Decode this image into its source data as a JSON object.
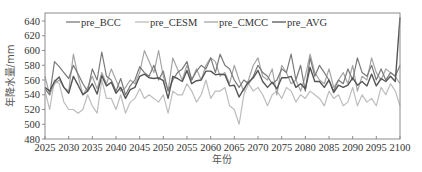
{
  "chart_data": {
    "type": "line",
    "title": "",
    "xlabel": "年份",
    "ylabel": "年降水量/mm",
    "xlim": [
      2025,
      2100
    ],
    "ylim": [
      480,
      650
    ],
    "x_ticks": [
      2025,
      2030,
      2035,
      2040,
      2045,
      2050,
      2055,
      2060,
      2065,
      2070,
      2075,
      2080,
      2085,
      2090,
      2095,
      2100
    ],
    "y_ticks": [
      480,
      500,
      520,
      540,
      560,
      580,
      600,
      620,
      640
    ],
    "grid": false,
    "legend_position": "top-inside",
    "x": [
      2025,
      2026,
      2027,
      2028,
      2029,
      2030,
      2031,
      2032,
      2033,
      2034,
      2035,
      2036,
      2037,
      2038,
      2039,
      2040,
      2041,
      2042,
      2043,
      2044,
      2045,
      2046,
      2047,
      2048,
      2049,
      2050,
      2051,
      2052,
      2053,
      2054,
      2055,
      2056,
      2057,
      2058,
      2059,
      2060,
      2061,
      2062,
      2063,
      2064,
      2065,
      2066,
      2067,
      2068,
      2069,
      2070,
      2071,
      2072,
      2073,
      2074,
      2075,
      2076,
      2077,
      2078,
      2079,
      2080,
      2081,
      2082,
      2083,
      2084,
      2085,
      2086,
      2087,
      2088,
      2089,
      2090,
      2091,
      2092,
      2093,
      2094,
      2095,
      2096,
      2097,
      2098,
      2099,
      2100
    ],
    "series": [
      {
        "name": "pre_BCC",
        "color": "#7a7a7a",
        "values": [
          548,
          540,
          585,
          578,
          570,
          562,
          580,
          568,
          555,
          545,
          575,
          560,
          598,
          565,
          560,
          545,
          562,
          540,
          552,
          560,
          578,
          570,
          565,
          580,
          560,
          572,
          545,
          560,
          570,
          575,
          585,
          560,
          572,
          580,
          575,
          590,
          570,
          595,
          580,
          575,
          560,
          550,
          560,
          555,
          565,
          580,
          570,
          565,
          555,
          560,
          575,
          570,
          595,
          560,
          580,
          545,
          590,
          565,
          580,
          570,
          560,
          545,
          560,
          555,
          575,
          560,
          590,
          570,
          565,
          580,
          560,
          575,
          560,
          570,
          565,
          580
        ]
      },
      {
        "name": "pre_CESM",
        "color": "#bdbdbd",
        "values": [
          545,
          520,
          560,
          555,
          530,
          520,
          520,
          515,
          520,
          540,
          525,
          515,
          560,
          535,
          535,
          520,
          540,
          515,
          530,
          535,
          548,
          535,
          540,
          535,
          530,
          540,
          515,
          545,
          540,
          540,
          555,
          545,
          530,
          540,
          560,
          535,
          545,
          545,
          550,
          525,
          520,
          500,
          540,
          555,
          545,
          550,
          540,
          525,
          540,
          545,
          535,
          550,
          545,
          530,
          540,
          535,
          545,
          540,
          535,
          525,
          545,
          535,
          540,
          525,
          530,
          550,
          525,
          540,
          530,
          535,
          525,
          550,
          540,
          555,
          545,
          525
        ]
      },
      {
        "name": "pre_CMCC",
        "color": "#a5a5a5",
        "values": [
          565,
          540,
          555,
          560,
          550,
          545,
          595,
          565,
          540,
          550,
          565,
          548,
          570,
          555,
          575,
          560,
          545,
          550,
          560,
          555,
          570,
          600,
          585,
          570,
          600,
          565,
          545,
          590,
          575,
          560,
          580,
          560,
          575,
          560,
          580,
          590,
          585,
          565,
          570,
          555,
          580,
          560,
          545,
          560,
          580,
          590,
          565,
          560,
          575,
          540,
          580,
          570,
          555,
          560,
          545,
          565,
          595,
          570,
          560,
          555,
          575,
          550,
          560,
          570,
          555,
          580,
          545,
          565,
          560,
          590,
          570,
          560,
          575,
          570,
          565,
          555
        ]
      },
      {
        "name": "pre_AVG",
        "color": "#555555",
        "values": [
          550,
          545,
          558,
          564,
          550,
          542,
          565,
          553,
          540,
          545,
          555,
          541,
          566,
          552,
          557,
          542,
          550,
          535,
          547,
          550,
          565,
          568,
          563,
          562,
          563,
          559,
          535,
          565,
          562,
          558,
          573,
          555,
          559,
          560,
          572,
          572,
          567,
          568,
          567,
          552,
          553,
          537,
          548,
          557,
          563,
          573,
          558,
          550,
          557,
          548,
          563,
          563,
          565,
          550,
          555,
          548,
          577,
          558,
          558,
          550,
          560,
          543,
          553,
          550,
          553,
          563,
          553,
          558,
          552,
          568,
          552,
          562,
          558,
          565,
          558,
          645
        ]
      }
    ]
  },
  "legend": [
    {
      "label": "pre_BCC"
    },
    {
      "label": "pre_CESM"
    },
    {
      "label": "pre_CMCC"
    },
    {
      "label": "pre_AVG"
    }
  ],
  "axes": {
    "xlabel": "年份",
    "ylabel": "年降水量/mm"
  }
}
